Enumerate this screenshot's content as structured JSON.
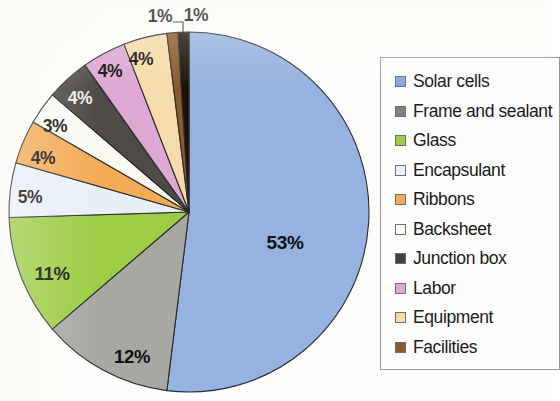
{
  "chart_data": {
    "type": "pie",
    "title": "",
    "subtitle": "",
    "xlabel": "",
    "ylabel": "",
    "grid": false,
    "legend_position": "right",
    "units": "percent",
    "categories": [
      "Solar cells",
      "Frame and sealant",
      "Glass",
      "Encapsulant",
      "Ribbons",
      "Backsheet",
      "Junction box",
      "Labor",
      "Equipment",
      "Facilities",
      "Utilities"
    ],
    "values": [
      53,
      12,
      11,
      5,
      4,
      3,
      4,
      4,
      4,
      1,
      1
    ],
    "labels": [
      "53%",
      "12%",
      "11%",
      "5%",
      "4%",
      "3%",
      "4%",
      "4%",
      "4%",
      "1%",
      "1%"
    ],
    "colors": [
      "#96b2e0",
      "#a8a8a3",
      "#9ccd45",
      "#e8f0f7",
      "#f3ab57",
      "#fbfaf2",
      "#4e4b46",
      "#dda8d2",
      "#f5dcaa",
      "#8a5a2b",
      "#1a1208"
    ],
    "legend_colors": [
      "#8aa8dc",
      "#808080",
      "#9ccd45",
      "#e9f0f7",
      "#f3ab57",
      "#fcfbf5",
      "#404040",
      "#dda8d2",
      "#f5dcaa",
      "#8a5a2b",
      "#151515"
    ],
    "start_angle_deg": -90,
    "direction": "clockwise",
    "slices": [
      {
        "name": "Solar cells",
        "value": 53,
        "label": "53%",
        "color": "#96b2e0",
        "label_x": 285,
        "label_y": 243
      },
      {
        "name": "Frame and sealant",
        "value": 12,
        "label": "12%",
        "color": "#a8a8a3",
        "label_x": 132,
        "label_y": 357
      },
      {
        "name": "Glass",
        "value": 11,
        "label": "11%",
        "color": "#9ccd45",
        "label_x": 52,
        "label_y": 274
      },
      {
        "name": "Encapsulant",
        "value": 5,
        "label": "5%",
        "color": "#e8f0f7",
        "label_x": 30,
        "label_y": 197
      },
      {
        "name": "Ribbons",
        "value": 4,
        "label": "4%",
        "color": "#f3ab57",
        "label_x": 43,
        "label_y": 158
      },
      {
        "name": "Backsheet",
        "value": 3,
        "label": "3%",
        "color": "#fbfaf2",
        "label_x": 55,
        "label_y": 126
      },
      {
        "name": "Junction box",
        "value": 4,
        "label": "4%",
        "color": "#4e4b46",
        "label_x": 80,
        "label_y": 98
      },
      {
        "name": "Labor",
        "value": 4,
        "label": "4%",
        "color": "#dda8d2",
        "label_x": 110,
        "label_y": 71
      },
      {
        "name": "Equipment",
        "value": 4,
        "label": "4%",
        "color": "#f5dcaa",
        "label_x": 141,
        "label_y": 59
      },
      {
        "name": "Facilities",
        "value": 1,
        "label": "1%",
        "color": "#8a5a2b",
        "label_x": 160,
        "label_y": 16
      },
      {
        "name": "Utilities",
        "value": 1,
        "label": "1%",
        "color": "#1a1208",
        "label_x": 196,
        "label_y": 15
      }
    ]
  },
  "legend": {
    "items": [
      {
        "label": "Solar cells",
        "color": "#8aa8dc"
      },
      {
        "label": "Frame and sealant",
        "color": "#808080"
      },
      {
        "label": "Glass",
        "color": "#9ccd45"
      },
      {
        "label": "Encapsulant",
        "color": "#e9f0f7"
      },
      {
        "label": "Ribbons",
        "color": "#f3ab57"
      },
      {
        "label": "Backsheet",
        "color": "#fcfbf5"
      },
      {
        "label": "Junction box",
        "color": "#404040"
      },
      {
        "label": "Labor",
        "color": "#dda8d2"
      },
      {
        "label": "Equipment",
        "color": "#f5dcaa"
      },
      {
        "label": "Facilities",
        "color": "#8a5a2b"
      },
      {
        "label": "Utilities",
        "color": "#151515"
      }
    ]
  }
}
